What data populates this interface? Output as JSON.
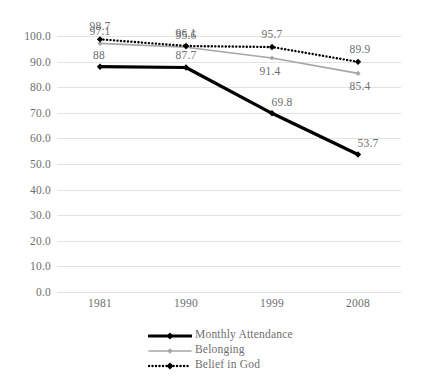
{
  "chart_data": {
    "type": "line",
    "title": "",
    "xlabel": "",
    "ylabel": "",
    "categories": [
      "1981",
      "1990",
      "1999",
      "2008"
    ],
    "ylim": [
      0,
      100
    ],
    "yticks": [
      "0.0",
      "10.0",
      "20.0",
      "30.0",
      "40.0",
      "50.0",
      "60.0",
      "70.0",
      "80.0",
      "90.0",
      "100.0"
    ],
    "ytick_values": [
      0,
      10,
      20,
      30,
      40,
      50,
      60,
      70,
      80,
      90,
      100
    ],
    "grid": true,
    "legend_position": "bottom",
    "series": [
      {
        "name": "Monthly Attendance",
        "values": [
          88,
          87.7,
          69.8,
          53.7
        ],
        "labels": [
          "88",
          "87.7",
          "69.8",
          "53.7"
        ],
        "color": "#000000",
        "style": "solid-thick",
        "marker": "diamond"
      },
      {
        "name": "Belonging",
        "values": [
          97.1,
          95.6,
          91.4,
          85.4
        ],
        "labels": [
          "97.1",
          "95.6",
          "91.4",
          "85.4"
        ],
        "color": "#a6a6a6",
        "style": "solid-thin",
        "marker": "diamond"
      },
      {
        "name": "Belief in God",
        "values": [
          98.7,
          96.1,
          95.7,
          89.9
        ],
        "labels": [
          "98.7",
          "96.1",
          "95.7",
          "89.9"
        ],
        "color": "#000000",
        "style": "dotted",
        "marker": "diamond"
      }
    ]
  }
}
